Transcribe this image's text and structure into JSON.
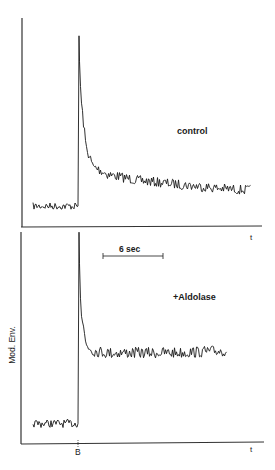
{
  "figure": {
    "ylabel": "Mod. Env.",
    "event_marker": "B",
    "xlabel": "t",
    "scale_bar_label": "6 sec",
    "trace_color": "#1a1a1a",
    "axis_color": "#333333"
  },
  "panels": [
    {
      "id": "top",
      "condition_label": "control",
      "xlabel": "t"
    },
    {
      "id": "bottom",
      "condition_label": "+Aldolase",
      "xlabel": "t",
      "event_marker": "B"
    }
  ],
  "chart_data": [
    {
      "type": "line",
      "title": "control",
      "xlabel": "t",
      "ylabel": "Mod. Env.",
      "grid": false,
      "annotations": [
        "B (stimulus onset)"
      ],
      "scale_bar": {
        "label": "6 sec",
        "seconds": 6
      },
      "series": [
        {
          "name": "control",
          "description": "low noisy baseline, sharp spike at B, fast decay then slow decline",
          "x_sec": [
            -4.5,
            -0.1,
            0,
            0.05,
            0.3,
            0.8,
            1.5,
            3,
            6,
            10,
            14,
            17.3
          ],
          "y_rel": [
            0.06,
            0.06,
            0.06,
            0.92,
            0.6,
            0.36,
            0.26,
            0.22,
            0.19,
            0.17,
            0.15,
            0.14
          ]
        }
      ]
    },
    {
      "type": "line",
      "title": "+Aldolase",
      "xlabel": "t",
      "ylabel": "Mod. Env.",
      "grid": false,
      "annotations": [
        "B (stimulus onset)",
        "6 sec scale bar"
      ],
      "scale_bar": {
        "label": "6 sec",
        "seconds": 6
      },
      "series": [
        {
          "name": "+Aldolase",
          "description": "low noisy baseline, sharp spike at B, fast decay to flat plateau",
          "x_sec": [
            -4.5,
            -0.1,
            0,
            0.05,
            0.3,
            0.8,
            1.5,
            3,
            6,
            10,
            14.9
          ],
          "y_rel": [
            0.06,
            0.06,
            0.06,
            0.98,
            0.6,
            0.44,
            0.41,
            0.4,
            0.4,
            0.4,
            0.41
          ]
        }
      ]
    }
  ]
}
